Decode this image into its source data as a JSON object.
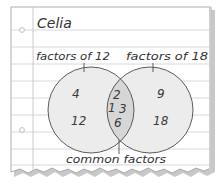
{
  "page": {
    "owner_name": "Celia",
    "paper_color": "#ffffff",
    "rule_color": "#c9ced6",
    "margin_color": "#c4c4c4",
    "shadow_color": "#8e8e8e"
  },
  "venn": {
    "left_set": {
      "label": "factors of 12",
      "only_values": [
        "4",
        "12"
      ],
      "fill": "#ececec"
    },
    "right_set": {
      "label": "factors of 18",
      "only_values": [
        "9",
        "18"
      ],
      "fill": "#ececec"
    },
    "intersection": {
      "label": "common factors",
      "values": [
        "2",
        "1",
        "3",
        "6"
      ],
      "fill": "#d6d6d6"
    },
    "outline_color": "#4a4a4a"
  }
}
